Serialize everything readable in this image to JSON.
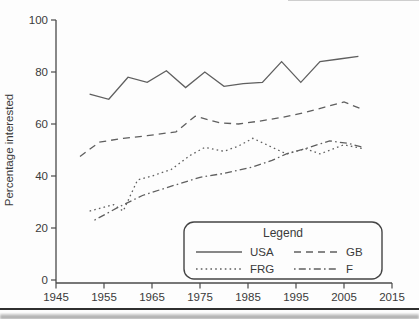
{
  "page": {
    "background": "#fdfdfd",
    "footer_rule_color": "#2f2f2f"
  },
  "colors": {
    "line": "#5f5f5f",
    "axis": "#4a4a4a",
    "text": "#3a3a3a",
    "legend_border": "#444444"
  },
  "chart_data": {
    "type": "line",
    "title": "",
    "xlabel": "",
    "ylabel": "Percentage interested",
    "xlim": [
      1945,
      2015
    ],
    "ylim": [
      0,
      100
    ],
    "x_ticks": [
      1945,
      1955,
      1965,
      1975,
      1985,
      1995,
      2005,
      2015
    ],
    "y_ticks": [
      0,
      20,
      40,
      60,
      80,
      100
    ],
    "grid": false,
    "legend": {
      "title": "Legend",
      "position": "bottom-right",
      "order": [
        [
          "USA",
          "GB"
        ],
        [
          "FRG",
          "F"
        ]
      ]
    },
    "series": [
      {
        "name": "USA",
        "line_style": "solid",
        "points": [
          [
            1952,
            71.5
          ],
          [
            1956,
            69.5
          ],
          [
            1960,
            78
          ],
          [
            1964,
            76
          ],
          [
            1968,
            80.5
          ],
          [
            1972,
            74
          ],
          [
            1976,
            80
          ],
          [
            1980,
            74.5
          ],
          [
            1984,
            75.5
          ],
          [
            1988,
            76
          ],
          [
            1992,
            84
          ],
          [
            1996,
            76
          ],
          [
            2000,
            84
          ],
          [
            2004,
            85
          ],
          [
            2008,
            86
          ]
        ]
      },
      {
        "name": "GB",
        "line_style": "dashed",
        "points": [
          [
            1950,
            47.5
          ],
          [
            1954,
            53
          ],
          [
            1959,
            54.5
          ],
          [
            1964,
            55.5
          ],
          [
            1970,
            57
          ],
          [
            1974,
            63
          ],
          [
            1979,
            60.5
          ],
          [
            1983,
            60
          ],
          [
            1987,
            61
          ],
          [
            1992,
            62.5
          ],
          [
            1997,
            64.5
          ],
          [
            2001,
            66.5
          ],
          [
            2005,
            68.5
          ],
          [
            2009,
            65.5
          ]
        ]
      },
      {
        "name": "FRG",
        "line_style": "dotted",
        "points": [
          [
            1952,
            26.5
          ],
          [
            1957,
            29
          ],
          [
            1959,
            26.5
          ],
          [
            1962,
            38.5
          ],
          [
            1965,
            40
          ],
          [
            1969,
            42.5
          ],
          [
            1973,
            48
          ],
          [
            1976,
            51
          ],
          [
            1980,
            49.5
          ],
          [
            1983,
            51.5
          ],
          [
            1986,
            54.5
          ],
          [
            1993,
            48.5
          ],
          [
            1997,
            50.5
          ],
          [
            2000,
            48.5
          ],
          [
            2005,
            52
          ],
          [
            2009,
            50.5
          ]
        ]
      },
      {
        "name": "F",
        "line_style": "dashdot",
        "points": [
          [
            1953,
            23
          ],
          [
            1958,
            28
          ],
          [
            1963,
            32.5
          ],
          [
            1968,
            35.5
          ],
          [
            1975,
            39.5
          ],
          [
            1980,
            41
          ],
          [
            1986,
            43.5
          ],
          [
            1990,
            46
          ],
          [
            1993,
            48.5
          ],
          [
            1996,
            50
          ],
          [
            2002,
            53.5
          ],
          [
            2006,
            52.5
          ],
          [
            2009,
            51
          ]
        ]
      }
    ]
  }
}
